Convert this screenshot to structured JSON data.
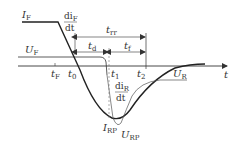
{
  "diagram": {
    "type": "diode-reverse-recovery-waveform",
    "axis": {
      "label": "t"
    },
    "labels": {
      "I_F": {
        "main": "I",
        "sub": "F"
      },
      "U_F": {
        "main": "U",
        "sub": "F"
      },
      "U_R": {
        "main": "U",
        "sub": "R"
      },
      "I_RP": {
        "main": "I",
        "sub": "RP"
      },
      "U_RP": {
        "main": "U",
        "sub": "RP"
      },
      "diF_dt": {
        "num": "di",
        "num_sub": "F",
        "den": "dt"
      },
      "diR_dt": {
        "num": "di",
        "num_sub": "R",
        "den": "dt"
      }
    },
    "time_marks": {
      "tF": {
        "main": "t",
        "sub": "F"
      },
      "t0": {
        "main": "t",
        "sub": "0"
      },
      "t1": {
        "main": "t",
        "sub": "1"
      },
      "t2": {
        "main": "t",
        "sub": "2"
      }
    },
    "intervals": {
      "trr": {
        "main": "t",
        "sub": "rr"
      },
      "td": {
        "main": "t",
        "sub": "d"
      },
      "tf": {
        "main": "t",
        "sub": "f"
      }
    },
    "colors": {
      "line": "#222222",
      "thin": "#444444"
    }
  }
}
